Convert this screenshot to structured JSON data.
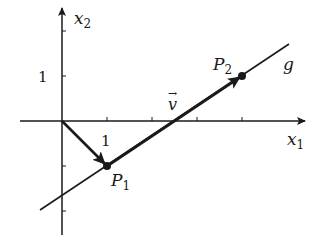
{
  "diagram": {
    "axes": {
      "x_label": "x",
      "x_sub": "1",
      "y_label": "x",
      "y_sub": "2",
      "x_tick_label": "1",
      "y_tick_label": "1"
    },
    "points": {
      "p1": {
        "name": "P",
        "sub": "1",
        "coords": [
          1,
          -1
        ]
      },
      "p2": {
        "name": "P",
        "sub": "2",
        "coords": [
          4,
          1
        ]
      }
    },
    "line_label": "g",
    "vector_label": "v",
    "vector_arrow": "→",
    "colors": {
      "ink": "#1a1a1a",
      "background": "#ffffff"
    }
  }
}
